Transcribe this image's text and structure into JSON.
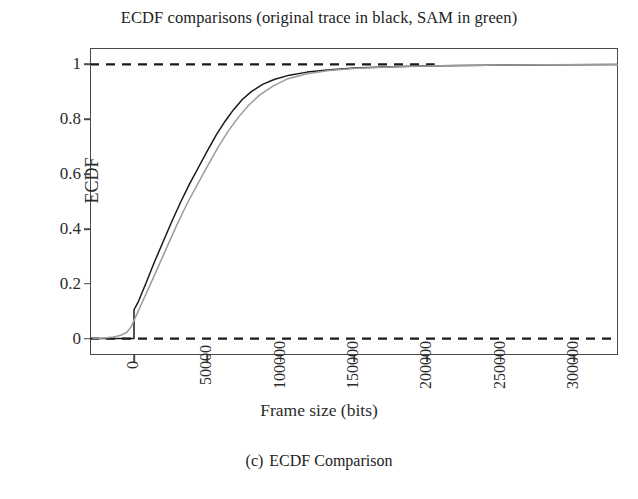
{
  "figure": {
    "title": "ECDF comparisons (original trace in black, SAM in green)",
    "caption_index": "(c)",
    "caption_text": "ECDF Comparison"
  },
  "chart_data": {
    "type": "line",
    "title": "ECDF comparisons (original trace in black, SAM in green)",
    "xlabel": "Frame size (bits)",
    "ylabel": "ECDF",
    "xlim": [
      -30000,
      330000
    ],
    "ylim": [
      -0.06,
      1.06
    ],
    "grid": false,
    "legend_position": "none",
    "xticks": [
      0,
      50000,
      100000,
      150000,
      200000,
      250000,
      300000
    ],
    "xtick_labels": [
      "0",
      "50000",
      "100000",
      "150000",
      "200000",
      "250000",
      "300000"
    ],
    "xtick_rotation": 90,
    "yticks": [
      0,
      0.2,
      0.4,
      0.6,
      0.8,
      1
    ],
    "ytick_labels": [
      "0",
      "0.2",
      "0.4",
      "0.6",
      "0.8",
      "1"
    ],
    "reference_lines": [
      {
        "name": "lower-bound",
        "y": 0,
        "style": "dashed",
        "color": "#1a1a1a"
      },
      {
        "name": "upper-bound",
        "y": 1,
        "style": "dashed",
        "color": "#1a1a1a"
      }
    ],
    "series": [
      {
        "name": "original trace",
        "color": "#1a1a1a",
        "style": "solid",
        "x": [
          -28000,
          -14000,
          -4000,
          0,
          0,
          3000,
          8000,
          14000,
          20000,
          26000,
          32000,
          38000,
          44000,
          50000,
          56000,
          62000,
          68000,
          74000,
          80000,
          88000,
          96000,
          106000,
          118000,
          132000,
          150000,
          170000,
          195000,
          225000,
          260000,
          295000,
          330000
        ],
        "y": [
          0.0,
          0.0,
          0.0,
          0.0,
          0.105,
          0.135,
          0.2,
          0.28,
          0.355,
          0.43,
          0.5,
          0.565,
          0.625,
          0.685,
          0.742,
          0.792,
          0.836,
          0.873,
          0.901,
          0.928,
          0.946,
          0.961,
          0.972,
          0.98,
          0.987,
          0.991,
          0.994,
          0.996,
          0.998,
          0.999,
          1.0
        ]
      },
      {
        "name": "SAM",
        "color": "#9b9b9b",
        "style": "solid",
        "x": [
          -28000,
          -20000,
          -14000,
          -9000,
          -5000,
          -2000,
          1000,
          5000,
          11000,
          17000,
          23000,
          29000,
          36000,
          43000,
          50000,
          57000,
          64000,
          71000,
          78000,
          86000,
          95000,
          105000,
          118000,
          133000,
          152000,
          175000,
          205000,
          240000,
          280000,
          330000
        ],
        "y": [
          0.0,
          0.002,
          0.006,
          0.012,
          0.022,
          0.042,
          0.078,
          0.125,
          0.196,
          0.268,
          0.34,
          0.412,
          0.49,
          0.56,
          0.628,
          0.695,
          0.755,
          0.806,
          0.85,
          0.89,
          0.922,
          0.948,
          0.966,
          0.978,
          0.986,
          0.991,
          0.995,
          0.997,
          0.999,
          1.0
        ]
      }
    ]
  }
}
